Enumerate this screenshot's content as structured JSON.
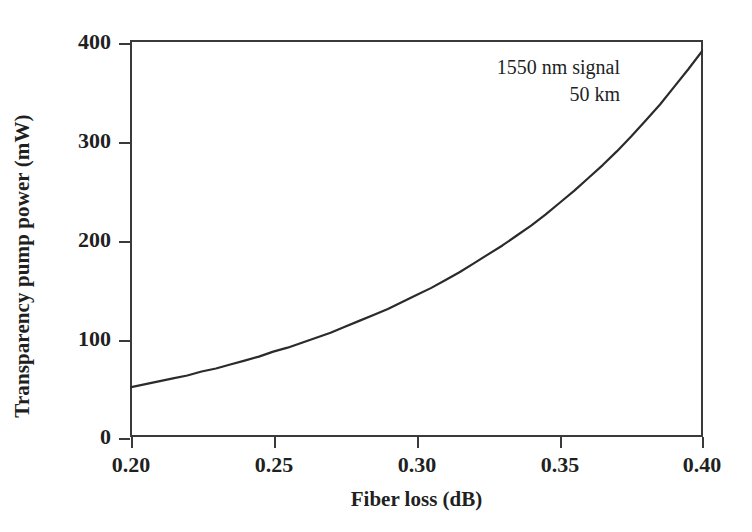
{
  "chart_data": {
    "type": "line",
    "title": "",
    "xlabel": "Fiber loss (dB)",
    "ylabel": "Transparency pump power (mW)",
    "xlim": [
      0.2,
      0.4
    ],
    "ylim": [
      0,
      400
    ],
    "xticks": [
      "0.20",
      "0.25",
      "0.30",
      "0.35",
      "0.40"
    ],
    "xtick_values": [
      0.2,
      0.25,
      0.3,
      0.35,
      0.4
    ],
    "yticks": [
      "0",
      "100",
      "200",
      "300",
      "400"
    ],
    "ytick_values": [
      0,
      100,
      200,
      300,
      400
    ],
    "grid": false,
    "legend": null,
    "annotations": [
      "1550 nm signal",
      "50 km"
    ],
    "series": [
      {
        "name": "transparency pump power",
        "color": "#2b2b2b",
        "x": [
          0.2,
          0.205,
          0.21,
          0.215,
          0.22,
          0.225,
          0.23,
          0.235,
          0.24,
          0.245,
          0.25,
          0.255,
          0.26,
          0.265,
          0.27,
          0.275,
          0.28,
          0.285,
          0.29,
          0.295,
          0.3,
          0.305,
          0.31,
          0.315,
          0.32,
          0.325,
          0.33,
          0.335,
          0.34,
          0.345,
          0.35,
          0.355,
          0.36,
          0.365,
          0.37,
          0.375,
          0.38,
          0.385,
          0.39,
          0.395,
          0.4
        ],
        "y": [
          50,
          53,
          56,
          59,
          62,
          66,
          69,
          73,
          77,
          81,
          86,
          90,
          95,
          100,
          105,
          111,
          117,
          123,
          129,
          136,
          143,
          150,
          158,
          166,
          175,
          184,
          193,
          203,
          213,
          224,
          236,
          248,
          261,
          274,
          288,
          303,
          319,
          335,
          353,
          371,
          390
        ]
      }
    ]
  },
  "axes": {
    "ylabel_text": "Transparency pump power (mW)",
    "xlabel_text": "Fiber loss (dB)"
  },
  "annotation": {
    "line1": "1550 nm signal",
    "line2": "50 km"
  },
  "ticks": {
    "y": [
      {
        "label": "400"
      },
      {
        "label": "300"
      },
      {
        "label": "200"
      },
      {
        "label": "100"
      },
      {
        "label": "0"
      }
    ],
    "x": [
      {
        "label": "0.20"
      },
      {
        "label": "0.25"
      },
      {
        "label": "0.30"
      },
      {
        "label": "0.35"
      },
      {
        "label": "0.40"
      }
    ]
  },
  "style": {
    "curve_color": "#2b2b2b",
    "frame_color": "#3a3a3a",
    "text_color": "#221f1f",
    "background": "#ffffff"
  }
}
